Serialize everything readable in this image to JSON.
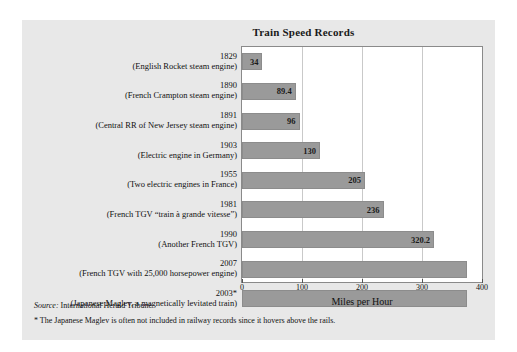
{
  "chart_data": {
    "type": "bar",
    "orientation": "horizontal",
    "title": "Train Speed Records",
    "xlabel": "Miles per Hour",
    "ylabel": "",
    "xlim": [
      0,
      400
    ],
    "xticks": [
      0,
      100,
      200,
      300,
      400
    ],
    "grid": true,
    "legend": "none",
    "categories": [
      {
        "year": "1829",
        "desc": "(English Rocket steam engine)"
      },
      {
        "year": "1890",
        "desc": "(French Crampton steam engine)"
      },
      {
        "year": "1891",
        "desc": "(Central RR of New Jersey steam engine)"
      },
      {
        "year": "1903",
        "desc": "(Electric engine in Germany)"
      },
      {
        "year": "1955",
        "desc": "(Two electric engines in France)"
      },
      {
        "year": "1981",
        "desc": "(French TGV “train à grande vitesse”)"
      },
      {
        "year": "1990",
        "desc": "(Another French TGV)"
      },
      {
        "year": "2007",
        "desc": "(French TGV with 25,000 horsepower engine)"
      },
      {
        "year": "2003*",
        "desc": "(Japanese Maglev, a magnetically levitated train)"
      }
    ],
    "values": [
      34,
      89.4,
      96,
      130,
      205,
      236,
      320.2,
      375,
      375
    ],
    "value_labels": [
      "34",
      "89.4",
      "96",
      "130",
      "205",
      "236",
      "320.2",
      "",
      ""
    ],
    "bar_color": "#9a9a9a",
    "plot_background": "#ffffff",
    "panel_background": "#e8e8e8"
  },
  "footnotes": {
    "source_prefix": "Source:",
    "source_text": " International Herald Tribune",
    "asterisk_note": "* The Japanese Maglev is often not included in railway records since it hovers above the rails."
  }
}
